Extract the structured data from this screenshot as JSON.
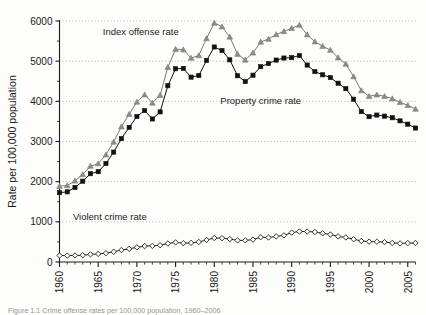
{
  "figure": {
    "caption": "Figure 1.1 Crime offense rates per 100,000 population, 1960–2006"
  },
  "chart_data": {
    "type": "line",
    "title": "",
    "subtitle": "",
    "xlabel": "",
    "ylabel": "Rate per 100,000  population",
    "xlim": [
      1960,
      2006
    ],
    "ylim": [
      0,
      6000
    ],
    "ytick_values": [
      0,
      1000,
      2000,
      3000,
      4000,
      5000,
      6000
    ],
    "ytick_labels": [
      "0",
      "1000",
      "2000",
      "3000",
      "4000",
      "5000",
      "6000"
    ],
    "xtick_values": [
      1960,
      1965,
      1970,
      1975,
      1980,
      1985,
      1990,
      1995,
      2000,
      2005
    ],
    "xtick_labels": [
      "1960",
      "1965",
      "1970",
      "1975",
      "1980",
      "1985",
      "1990",
      "1995",
      "2000",
      "2005"
    ],
    "xminor_step": 1,
    "grid": "horizontal-dotted",
    "legend_position": "inline-annotations",
    "x": [
      1960,
      1961,
      1962,
      1963,
      1964,
      1965,
      1966,
      1967,
      1968,
      1969,
      1970,
      1971,
      1972,
      1973,
      1974,
      1975,
      1976,
      1977,
      1978,
      1979,
      1980,
      1981,
      1982,
      1983,
      1984,
      1985,
      1986,
      1987,
      1988,
      1989,
      1990,
      1991,
      1992,
      1993,
      1994,
      1995,
      1996,
      1997,
      1998,
      1999,
      2000,
      2001,
      2002,
      2003,
      2004,
      2005,
      2006
    ],
    "series": [
      {
        "name": "Index offense rate",
        "label": "Index offense rate",
        "marker": "triangle",
        "color": "#8c8c8c",
        "line_color": "#7a7a7a",
        "values": [
          1887,
          1906,
          2020,
          2180,
          2388,
          2449,
          2671,
          2990,
          3370,
          3680,
          3985,
          4165,
          3961,
          4154,
          4850,
          5299,
          5287,
          5078,
          5140,
          5566,
          5950,
          5858,
          5604,
          5175,
          5031,
          5207,
          5480,
          5550,
          5664,
          5741,
          5820,
          5898,
          5660,
          5484,
          5374,
          5275,
          5087,
          4930,
          4616,
          4267,
          4125,
          4163,
          4125,
          4067,
          3977,
          3900,
          3809
        ]
      },
      {
        "name": "Property crime rate",
        "label": "Property crime rate",
        "marker": "square",
        "color": "#111111",
        "line_color": "#111111",
        "values": [
          1726,
          1747,
          1857,
          2012,
          2198,
          2249,
          2451,
          2736,
          3072,
          3351,
          3621,
          3769,
          3561,
          3737,
          4389,
          4811,
          4820,
          4602,
          4643,
          5017,
          5353,
          5264,
          5033,
          4637,
          4492,
          4651,
          4863,
          4940,
          5027,
          5078,
          5088,
          5140,
          4903,
          4740,
          4660,
          4591,
          4451,
          4316,
          4053,
          3744,
          3618,
          3658,
          3631,
          3591,
          3514,
          3432,
          3335
        ]
      },
      {
        "name": "Violent crime rate",
        "label": "Violent crime rate",
        "marker": "diamond",
        "color": "#222222",
        "line_color": "#222222",
        "values": [
          161,
          159,
          163,
          168,
          191,
          200,
          220,
          254,
          298,
          329,
          364,
          396,
          401,
          417,
          461,
          488,
          468,
          476,
          498,
          549,
          597,
          594,
          571,
          538,
          539,
          557,
          618,
          610,
          637,
          663,
          732,
          758,
          758,
          747,
          714,
          685,
          637,
          611,
          568,
          523,
          507,
          505,
          495,
          476,
          463,
          469,
          474
        ]
      }
    ],
    "annotations": [
      {
        "text": "Index offense rate",
        "year": 1970.5,
        "value": 5660,
        "series": "Index offense rate"
      },
      {
        "text": "Property crime rate",
        "year": 1986.0,
        "value": 3940,
        "series": "Property crime rate"
      },
      {
        "text": "Violent crime rate",
        "year": 1966.5,
        "value": 1040,
        "series": "Violent crime rate"
      }
    ]
  }
}
